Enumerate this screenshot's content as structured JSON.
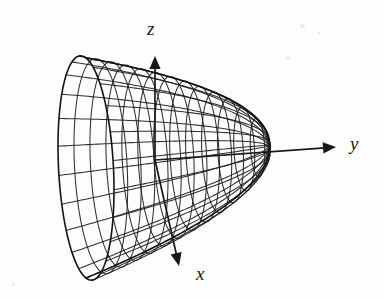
{
  "figure": {
    "kind": "3d-wireframe-surface-plot",
    "background_color": "#fdfdfd",
    "line_color": "#1a1a1d",
    "axes": [
      {
        "id": "z",
        "label": "z",
        "direction": "up",
        "label_x": 147,
        "label_y": 19,
        "from": [
          155,
          160
        ],
        "to": [
          155,
          56
        ]
      },
      {
        "id": "y",
        "label": "y",
        "direction": "right",
        "label_x": 350,
        "label_y": 134,
        "from": [
          155,
          160
        ],
        "to": [
          336,
          147
        ]
      },
      {
        "id": "x",
        "label": "x",
        "direction": "down-left",
        "label_x": 196,
        "label_y": 264,
        "from": [
          155,
          160
        ],
        "to": [
          179,
          266
        ]
      }
    ],
    "surface": {
      "description": "circular paraboloid / horn opening toward the viewer-left along the negative y axis",
      "axis_of_revolution": "y",
      "apex": [
        270,
        146
      ],
      "rim_center": [
        86,
        168
      ],
      "rim_radius_x": 64,
      "rim_radius_y": 110,
      "mesh_rings": 13,
      "mesh_meridians": 24,
      "extent": {
        "left": 22,
        "right": 272,
        "top": 59,
        "bottom": 279
      }
    }
  },
  "chart_data": {
    "type": "line",
    "title": "",
    "subtitle": "",
    "xlabel": "y",
    "ylabel": "z",
    "zlabel": "x",
    "legend": [],
    "annotations": [
      "z",
      "y",
      "x"
    ],
    "grid": true,
    "projection": "3d-wireframe",
    "surface_equation": "y = x^2 + z^2 (paraboloid of revolution about the y-axis)",
    "axis_ticks": {
      "x": [],
      "y": [],
      "z": []
    },
    "series": [
      {
        "name": "paraboloid-mesh-rings",
        "count": 13
      },
      {
        "name": "paraboloid-mesh-meridians",
        "count": 24
      }
    ]
  }
}
